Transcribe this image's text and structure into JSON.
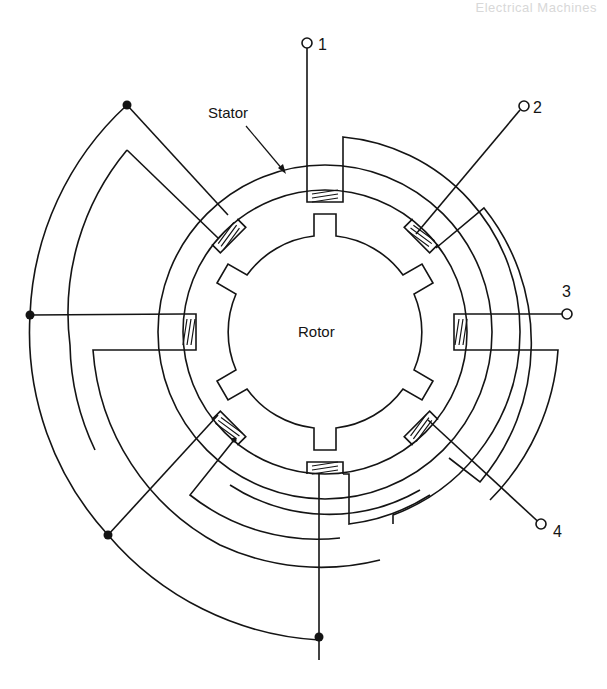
{
  "header": {
    "running_title": "Electrical Machines"
  },
  "diagram": {
    "type": "stepper-motor-winding-schematic",
    "labels": {
      "stator": "Stator",
      "rotor": "Rotor"
    },
    "terminals": [
      {
        "id": "1",
        "label": "1"
      },
      {
        "id": "2",
        "label": "2"
      },
      {
        "id": "3",
        "label": "3"
      },
      {
        "id": "4",
        "label": "4"
      }
    ],
    "stator_poles": 8,
    "rotor_teeth": 6,
    "junction_dots": 5,
    "colors": {
      "line": "#141414",
      "background": "#ffffff"
    }
  }
}
